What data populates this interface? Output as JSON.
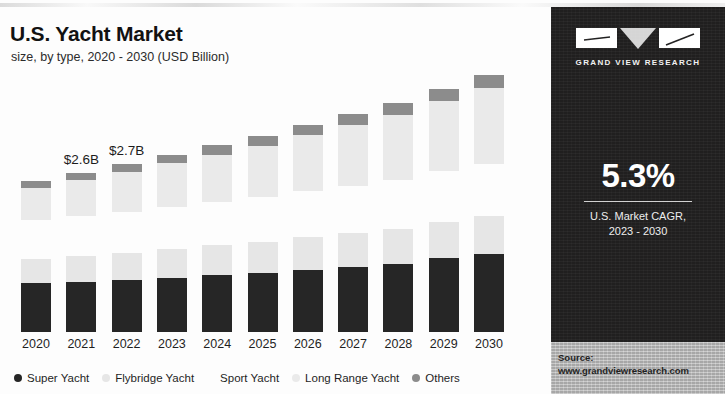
{
  "header": {
    "title": "U.S. Yacht Market",
    "subtitle": "size, by type, 2020 - 2030 (USD Billion)"
  },
  "side_panel": {
    "logo_text": "GRAND VIEW RESEARCH",
    "logo_icon": "gvr-logo-icon",
    "cagr_value": "5.3%",
    "cagr_caption_line1": "U.S. Market CAGR,",
    "cagr_caption_line2": "2023 - 2030",
    "source_label": "Source:",
    "source_url": "www.grandviewresearch.com",
    "background_color": "#201f1f"
  },
  "chart_data": {
    "type": "bar",
    "stacked": true,
    "title": "U.S. Yacht Market",
    "subtitle": "size, by type, 2020 - 2030 (USD Billion)",
    "xlabel": "",
    "ylabel": "",
    "grid": false,
    "legend_position": "bottom",
    "ylim": [
      0,
      4.4
    ],
    "categories": [
      "2020",
      "2021",
      "2022",
      "2023",
      "2024",
      "2025",
      "2026",
      "2027",
      "2028",
      "2029",
      "2030"
    ],
    "point_labels": {
      "2021": "$2.6B",
      "2022": "$2.7B"
    },
    "series": [
      {
        "name": "Super Yacht",
        "color": "#262626",
        "values": [
          0.78,
          0.8,
          0.83,
          0.87,
          0.91,
          0.95,
          1.0,
          1.05,
          1.1,
          1.19,
          1.26
        ]
      },
      {
        "name": "Flybridge Yacht",
        "color": "#e6e6e6",
        "values": [
          0.4,
          0.42,
          0.44,
          0.46,
          0.48,
          0.5,
          0.52,
          0.54,
          0.56,
          0.58,
          0.6
        ]
      },
      {
        "name": "Sport Yacht",
        "color": "#fdfdfd",
        "values": [
          0.62,
          0.64,
          0.66,
          0.68,
          0.7,
          0.72,
          0.74,
          0.76,
          0.79,
          0.81,
          0.84
        ]
      },
      {
        "name": "Long Range Yacht",
        "color": "#eaeaea",
        "values": [
          0.52,
          0.58,
          0.64,
          0.7,
          0.76,
          0.82,
          0.9,
          0.97,
          1.04,
          1.13,
          1.22
        ]
      },
      {
        "name": "Others",
        "color": "#8c8c8c",
        "values": [
          0.11,
          0.12,
          0.13,
          0.14,
          0.15,
          0.16,
          0.17,
          0.18,
          0.19,
          0.2,
          0.21
        ]
      }
    ],
    "totals": [
      2.43,
      2.56,
      2.7,
      2.85,
      3.0,
      3.15,
      3.33,
      3.5,
      3.68,
      3.91,
      4.13
    ]
  }
}
